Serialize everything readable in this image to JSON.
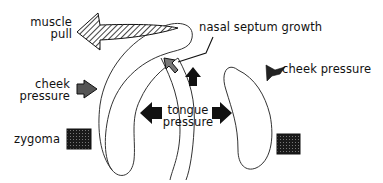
{
  "diagram": {
    "labels": {
      "muscle_pull": [
        "muscle",
        "pull"
      ],
      "nasal_septum_growth": "nasal septum growth",
      "cheek_pressure_left": [
        "cheek",
        "pressure"
      ],
      "cheek_pressure_right": "cheek pressure",
      "tongue_pressure": [
        "tongue",
        "pressure"
      ],
      "zygoma": "zygoma"
    },
    "icons": [
      "muscle-pull-hatched-arrow",
      "nasal-septum-arrow",
      "upward-growth-arrow",
      "cheek-pressure-left-arrow",
      "cheek-pressure-right-arrow",
      "tongue-pressure-left-arrow",
      "tongue-pressure-right-arrow",
      "zygoma-left-block",
      "zygoma-right-block"
    ],
    "colors": {
      "ink": "#111111",
      "background": "#ffffff",
      "outline": "#333333"
    }
  }
}
